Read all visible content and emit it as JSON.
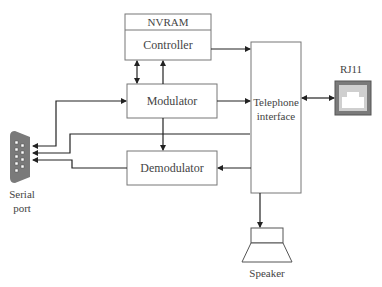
{
  "diagram": {
    "blocks": {
      "nvram": "NVRAM",
      "controller": "Controller",
      "modulator": "Modulator",
      "demodulator": "Demodulator",
      "telephone_line1": "Telephone",
      "telephone_line2": "interface"
    },
    "connectors": {
      "rj11": "RJ11",
      "serial_line1": "Serial",
      "serial_line2": "port",
      "speaker": "Speaker"
    },
    "colors": {
      "line": "#222222",
      "box_border": "#777777",
      "connector_fill": "#7a7a7a"
    }
  }
}
